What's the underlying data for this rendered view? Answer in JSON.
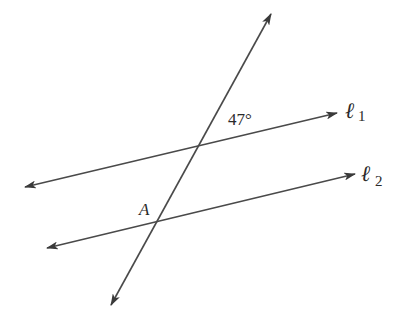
{
  "diagram": {
    "type": "geometry",
    "lines": {
      "l1": {
        "name": "ℓ",
        "subscript": "1",
        "start": [
          25,
          187
        ],
        "end": [
          337,
          113
        ]
      },
      "l2": {
        "name": "ℓ",
        "subscript": "2",
        "start": [
          47,
          248
        ],
        "end": [
          355,
          174
        ]
      },
      "transversal": {
        "start": [
          111,
          305
        ],
        "end": [
          271,
          14
        ]
      }
    },
    "intersections": {
      "upper": [
        200,
        146
      ],
      "lower": [
        157,
        225
      ]
    },
    "labels": {
      "angle": "47°",
      "point": "A",
      "l1_main": "ℓ",
      "l1_sub": "1",
      "l2_main": "ℓ",
      "l2_sub": "2"
    },
    "colors": {
      "line": "#4a4a4a",
      "text": "#2a2a2a",
      "background": "#ffffff"
    }
  }
}
